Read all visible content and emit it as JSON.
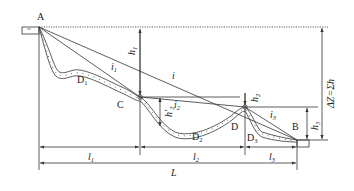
{
  "diagram": {
    "type": "longitudinal channel slope profile",
    "points": {
      "A": "A",
      "B": "B",
      "C": "C",
      "D": "D",
      "D1": "D",
      "D2": "D",
      "D3": "D"
    },
    "point_subscripts": {
      "D1": "1",
      "D2": "2",
      "D3": "3"
    },
    "slopes": {
      "i": "i",
      "i1": "i",
      "i1_sub": "1",
      "i2": "i",
      "i2_sub": "2",
      "i3": "i",
      "i3_sub": "3"
    },
    "heights": {
      "h1": "h",
      "h1_sub": "1",
      "h2": "h",
      "h2_sub": "2",
      "h2_prime": "h'",
      "h2_prime_sub": "2",
      "h3": "h",
      "h3_sub": "3",
      "total": "ΔZ=Σh"
    },
    "lengths": {
      "l1": "l",
      "l1_sub": "1",
      "l2": "l",
      "l2_sub": "2",
      "l3": "l",
      "l3_sub": "3",
      "L": "L"
    },
    "colors": {
      "line": "#333333",
      "background": "#ffffff"
    }
  }
}
